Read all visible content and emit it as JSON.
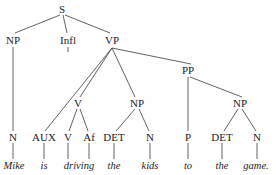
{
  "diagram": {
    "sentence": "Mike is driving the kids to the game.",
    "line_color": "#3a3a3a",
    "text_color": "#1c1c1c",
    "background_color": "#ffffff"
  },
  "nodes": [
    {
      "id": "S",
      "label": "S",
      "kind": "category",
      "x": 62,
      "y": 9
    },
    {
      "id": "NP1",
      "label": "NP",
      "kind": "category",
      "x": 13,
      "y": 40
    },
    {
      "id": "INFL",
      "label": "Infl",
      "kind": "category",
      "x": 68,
      "y": 40
    },
    {
      "id": "VP",
      "label": "VP",
      "kind": "category",
      "x": 112,
      "y": 40
    },
    {
      "id": "PP",
      "label": "PP",
      "kind": "category",
      "x": 188,
      "y": 70
    },
    {
      "id": "V1",
      "label": "V",
      "kind": "category",
      "x": 78,
      "y": 103
    },
    {
      "id": "NP2",
      "label": "NP",
      "kind": "category",
      "x": 137,
      "y": 103
    },
    {
      "id": "NP3",
      "label": "NP",
      "kind": "category",
      "x": 240,
      "y": 103
    },
    {
      "id": "N1",
      "label": "N",
      "kind": "category",
      "x": 13,
      "y": 137
    },
    {
      "id": "AUX",
      "label": "AUX",
      "kind": "category",
      "x": 44,
      "y": 137
    },
    {
      "id": "V2",
      "label": "V",
      "kind": "category",
      "x": 68,
      "y": 137
    },
    {
      "id": "AF",
      "label": "Af",
      "kind": "category",
      "x": 89,
      "y": 137
    },
    {
      "id": "DET1",
      "label": "DET",
      "kind": "category",
      "x": 114,
      "y": 137
    },
    {
      "id": "N2",
      "label": "N",
      "kind": "category",
      "x": 150,
      "y": 137
    },
    {
      "id": "P",
      "label": "P",
      "kind": "category",
      "x": 188,
      "y": 137
    },
    {
      "id": "DET2",
      "label": "DET",
      "kind": "category",
      "x": 222,
      "y": 137
    },
    {
      "id": "N3",
      "label": "N",
      "kind": "category",
      "x": 257,
      "y": 137
    },
    {
      "id": "W_MIKE",
      "label": "Mike",
      "kind": "word",
      "x": 14,
      "y": 166
    },
    {
      "id": "W_IS",
      "label": "is",
      "kind": "word",
      "x": 44,
      "y": 166
    },
    {
      "id": "W_DRIV",
      "label": "driving",
      "kind": "word",
      "x": 79,
      "y": 166
    },
    {
      "id": "W_THE1",
      "label": "the",
      "kind": "word",
      "x": 114,
      "y": 166
    },
    {
      "id": "W_KIDS",
      "label": "kids",
      "kind": "word",
      "x": 150,
      "y": 166
    },
    {
      "id": "W_TO",
      "label": "to",
      "kind": "word",
      "x": 188,
      "y": 166
    },
    {
      "id": "W_THE2",
      "label": "the",
      "kind": "word",
      "x": 222,
      "y": 166
    },
    {
      "id": "W_GAME",
      "label": "game.",
      "kind": "word",
      "x": 256,
      "y": 166
    }
  ],
  "edges": [
    {
      "from": "S",
      "to": "NP1",
      "x1": 60,
      "y1": 15,
      "x2": 15,
      "y2": 33
    },
    {
      "from": "S",
      "to": "INFL",
      "x1": 63,
      "y1": 15,
      "x2": 67,
      "y2": 33
    },
    {
      "from": "S",
      "to": "VP",
      "x1": 65,
      "y1": 15,
      "x2": 110,
      "y2": 33
    },
    {
      "from": "NP1",
      "to": "N1",
      "x1": 13,
      "y1": 47,
      "x2": 13,
      "y2": 131
    },
    {
      "from": "INFL",
      "to": "AUX",
      "x1": 68,
      "y1": 47,
      "x2": 68,
      "y2": 52
    },
    {
      "from": "VP",
      "to": "AUX",
      "x1": 112,
      "y1": 48,
      "x2": 45,
      "y2": 131
    },
    {
      "from": "VP",
      "to": "V1",
      "x1": 112,
      "y1": 48,
      "x2": 80,
      "y2": 97
    },
    {
      "from": "VP",
      "to": "NP2",
      "x1": 112,
      "y1": 48,
      "x2": 135,
      "y2": 97
    },
    {
      "from": "VP",
      "to": "PP",
      "x1": 112,
      "y1": 48,
      "x2": 191,
      "y2": 64
    },
    {
      "from": "V1",
      "to": "V2",
      "x1": 77,
      "y1": 109,
      "x2": 69,
      "y2": 131
    },
    {
      "from": "V1",
      "to": "AF",
      "x1": 80,
      "y1": 109,
      "x2": 88,
      "y2": 131
    },
    {
      "from": "NP2",
      "to": "DET1",
      "x1": 135,
      "y1": 109,
      "x2": 116,
      "y2": 131
    },
    {
      "from": "NP2",
      "to": "N2",
      "x1": 139,
      "y1": 109,
      "x2": 149,
      "y2": 131
    },
    {
      "from": "PP",
      "to": "P",
      "x1": 188,
      "y1": 77,
      "x2": 188,
      "y2": 131
    },
    {
      "from": "PP",
      "to": "NP3",
      "x1": 190,
      "y1": 77,
      "x2": 242,
      "y2": 97
    },
    {
      "from": "NP3",
      "to": "DET2",
      "x1": 238,
      "y1": 109,
      "x2": 224,
      "y2": 131
    },
    {
      "from": "NP3",
      "to": "N3",
      "x1": 242,
      "y1": 109,
      "x2": 256,
      "y2": 131
    },
    {
      "from": "N1",
      "to": "W_MIKE",
      "x1": 13,
      "y1": 143,
      "x2": 13,
      "y2": 159
    },
    {
      "from": "AUX",
      "to": "W_IS",
      "x1": 44,
      "y1": 143,
      "x2": 44,
      "y2": 159
    },
    {
      "from": "V2",
      "to": "W_DRIV_L",
      "x1": 68,
      "y1": 143,
      "x2": 68,
      "y2": 159
    },
    {
      "from": "AF",
      "to": "W_DRIV_R",
      "x1": 89,
      "y1": 143,
      "x2": 89,
      "y2": 159
    },
    {
      "from": "DET1",
      "to": "W_THE1",
      "x1": 114,
      "y1": 143,
      "x2": 114,
      "y2": 159
    },
    {
      "from": "N2",
      "to": "W_KIDS",
      "x1": 150,
      "y1": 143,
      "x2": 150,
      "y2": 159
    },
    {
      "from": "P",
      "to": "W_TO",
      "x1": 188,
      "y1": 143,
      "x2": 188,
      "y2": 159
    },
    {
      "from": "DET2",
      "to": "W_THE2",
      "x1": 222,
      "y1": 143,
      "x2": 222,
      "y2": 159
    },
    {
      "from": "N3",
      "to": "W_GAME",
      "x1": 257,
      "y1": 143,
      "x2": 257,
      "y2": 159
    }
  ]
}
